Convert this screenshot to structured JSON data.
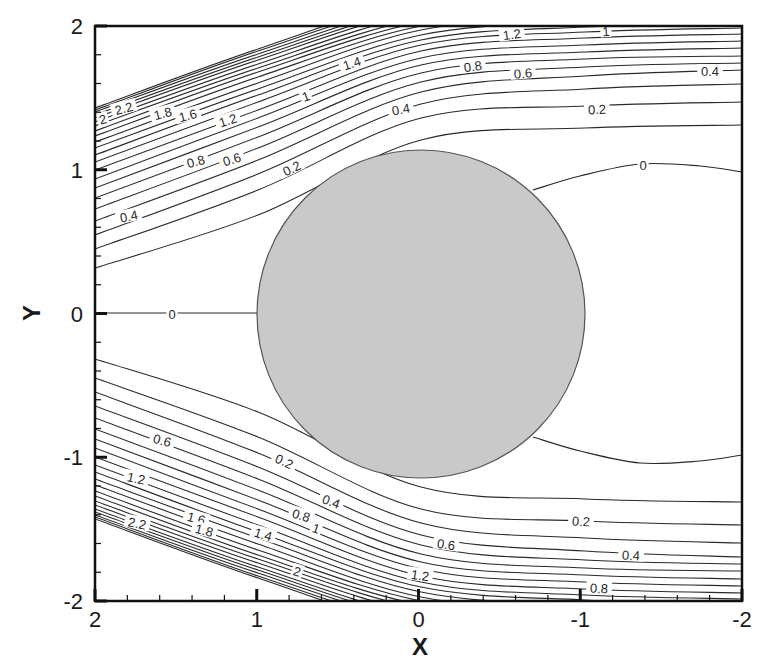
{
  "chart_data": {
    "type": "contour",
    "title": "",
    "xlabel": "X",
    "ylabel": "Y",
    "xlim": [
      2,
      -2
    ],
    "ylim": [
      -2,
      2
    ],
    "x_axis_reversed": true,
    "x_ticks": [
      "2",
      "1",
      "0",
      "-1",
      "-2"
    ],
    "y_ticks": [
      "2",
      "1",
      "0",
      "-1",
      "-2"
    ],
    "minor_tick_step": 0.2,
    "grid": false,
    "legend": "none",
    "contour_levels": [
      0,
      0.1,
      0.2,
      0.3,
      0.4,
      0.5,
      0.6,
      0.7,
      0.8,
      0.9,
      1.0,
      1.1,
      1.2,
      1.3,
      1.4,
      1.5,
      1.6,
      1.7,
      1.8,
      1.9,
      2.0,
      2.1,
      2.2
    ],
    "symmetry": "mirror about Y=0",
    "obstacle": {
      "shape": "circle",
      "center": [
        0,
        0
      ],
      "fill": "#c9c9c9",
      "stroke": "#555555"
    },
    "contour_edge_positions_px": {
      "sample_x": [
        95,
        258,
        421,
        585,
        742
      ],
      "upper": {
        "0.1": [
          268,
          215,
          140,
          128,
          125
        ],
        "0.2": [
          249,
          190,
          118,
          106,
          102
        ],
        "0.3": [
          235,
          174,
          104,
          89,
          84
        ],
        "0.4": [
          221,
          160,
          92,
          76,
          70
        ],
        "0.5": [
          209,
          148,
          82,
          67,
          63
        ],
        "0.6": [
          198,
          137,
          73,
          59,
          56
        ],
        "0.7": [
          188,
          127,
          65,
          52,
          48
        ],
        "0.8": [
          179,
          118,
          58,
          45,
          41
        ],
        "0.9": [
          170,
          110,
          51,
          38,
          34
        ],
        "1.0": [
          162,
          102,
          45,
          32,
          28
        ],
        "1.1": [
          155,
          95,
          40,
          27,
          23
        ],
        "1.2": [
          148,
          89,
          35,
          22,
          18
        ],
        "1.3": [
          142,
          83,
          30,
          17,
          13
        ],
        "1.4": [
          136,
          77,
          26,
          12,
          8
        ],
        "1.5": [
          131,
          72,
          22,
          7,
          3
        ],
        "1.6": [
          126,
          68,
          18,
          2,
          -2
        ],
        "1.7": [
          122,
          64,
          14,
          -2,
          -6
        ],
        "1.8": [
          118,
          60,
          10,
          -6,
          -10
        ],
        "1.9": [
          115,
          57,
          7,
          -10,
          -14
        ],
        "2.0": [
          112,
          54,
          4,
          -13,
          -17
        ],
        "2.1": [
          110,
          51,
          1,
          -16,
          -20
        ],
        "2.2": [
          108,
          49,
          -2,
          -19,
          -23
        ]
      },
      "wake_zero_upper": [
        [
          533,
          190
        ],
        [
          580,
          176
        ],
        [
          640,
          164
        ],
        [
          700,
          166
        ],
        [
          742,
          172
        ]
      ],
      "centerline_zero": [
        [
          95,
          313
        ],
        [
          258,
          313
        ]
      ]
    },
    "contour_labels": [
      {
        "text": "2",
        "x": 103,
        "y": 120,
        "rot": -15
      },
      {
        "text": "2.2",
        "x": 124,
        "y": 109,
        "rot": -15
      },
      {
        "text": "1.8",
        "x": 163,
        "y": 114,
        "rot": -15
      },
      {
        "text": "1.6",
        "x": 188,
        "y": 116,
        "rot": -15
      },
      {
        "text": "1.2",
        "x": 228,
        "y": 121,
        "rot": -18
      },
      {
        "text": "1.4",
        "x": 352,
        "y": 64,
        "rot": -18
      },
      {
        "text": "1",
        "x": 306,
        "y": 97,
        "rot": -20
      },
      {
        "text": "0.8",
        "x": 196,
        "y": 162,
        "rot": -15
      },
      {
        "text": "0.6",
        "x": 232,
        "y": 160,
        "rot": -17
      },
      {
        "text": "0.4",
        "x": 129,
        "y": 217,
        "rot": -12
      },
      {
        "text": "0.2",
        "x": 292,
        "y": 169,
        "rot": -25
      },
      {
        "text": "0.4",
        "x": 401,
        "y": 110,
        "rot": -10
      },
      {
        "text": "0.8",
        "x": 473,
        "y": 67,
        "rot": -8
      },
      {
        "text": "1.2",
        "x": 512,
        "y": 35,
        "rot": -8
      },
      {
        "text": "1",
        "x": 606,
        "y": 32,
        "rot": -5
      },
      {
        "text": "0.6",
        "x": 523,
        "y": 74,
        "rot": -5
      },
      {
        "text": "0.2",
        "x": 597,
        "y": 110,
        "rot": -3
      },
      {
        "text": "0.4",
        "x": 710,
        "y": 72,
        "rot": 0
      },
      {
        "text": "0",
        "x": 643,
        "y": 166,
        "rot": 0
      },
      {
        "text": "0",
        "x": 172,
        "y": 315,
        "rot": 0
      },
      {
        "text": "0.6",
        "x": 162,
        "y": 441,
        "rot": 15
      },
      {
        "text": "0.2",
        "x": 284,
        "y": 462,
        "rot": 25
      },
      {
        "text": "1.2",
        "x": 136,
        "y": 479,
        "rot": 12
      },
      {
        "text": "0.4",
        "x": 331,
        "y": 502,
        "rot": 20
      },
      {
        "text": "0.8",
        "x": 301,
        "y": 516,
        "rot": 17
      },
      {
        "text": "1",
        "x": 316,
        "y": 529,
        "rot": 18
      },
      {
        "text": "1.6",
        "x": 196,
        "y": 519,
        "rot": 15
      },
      {
        "text": "1.8",
        "x": 204,
        "y": 531,
        "rot": 15
      },
      {
        "text": "2.2",
        "x": 137,
        "y": 524,
        "rot": 12
      },
      {
        "text": "1.4",
        "x": 263,
        "y": 535,
        "rot": 17
      },
      {
        "text": "2",
        "x": 297,
        "y": 572,
        "rot": 18
      },
      {
        "text": "0.6",
        "x": 446,
        "y": 545,
        "rot": 8
      },
      {
        "text": "1.2",
        "x": 420,
        "y": 576,
        "rot": 8
      },
      {
        "text": "0.2",
        "x": 581,
        "y": 522,
        "rot": 3
      },
      {
        "text": "0.4",
        "x": 631,
        "y": 556,
        "rot": 3
      },
      {
        "text": "0.8",
        "x": 599,
        "y": 589,
        "rot": 3
      }
    ]
  },
  "axes": {
    "x_title": "X",
    "y_title": "Y",
    "x_tick_labels": [
      "2",
      "1",
      "0",
      "-1",
      "-2"
    ],
    "y_tick_labels": [
      "2",
      "1",
      "0",
      "-1",
      "-2"
    ]
  }
}
